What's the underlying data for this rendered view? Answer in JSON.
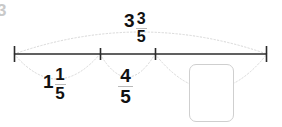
{
  "page": {
    "background_color": "#ffffff",
    "corner_mark": "3",
    "corner_mark_color": "#c9c9c9"
  },
  "diagram": {
    "type": "number-line-jump-diagram",
    "line_color": "#2b2b2b",
    "arc_color": "#d5d5d5",
    "arc_style": "dotted",
    "axis": {
      "x_start": 14,
      "x_end": 267,
      "y": 54,
      "ticks": [
        {
          "name": "tick-start",
          "x": 14,
          "height": 16
        },
        {
          "name": "tick-1",
          "x": 100,
          "height": 12
        },
        {
          "name": "tick-2",
          "x": 155,
          "height": 12
        },
        {
          "name": "tick-end",
          "x": 267,
          "height": 16
        }
      ]
    },
    "arcs": [
      {
        "name": "arc-total",
        "from_x": 14,
        "to_x": 267,
        "direction": "up",
        "label_id": "total"
      },
      {
        "name": "arc-segment-1",
        "from_x": 14,
        "to_x": 100,
        "direction": "down",
        "label_id": "seg1"
      },
      {
        "name": "arc-segment-2",
        "from_x": 100,
        "to_x": 155,
        "direction": "down",
        "label_id": "seg2"
      },
      {
        "name": "arc-segment-3",
        "from_x": 155,
        "to_x": 267,
        "direction": "down",
        "label_id": "seg3"
      }
    ]
  },
  "labels": {
    "total": {
      "name": "total-value",
      "type": "mixed-number",
      "whole": "3",
      "numerator": "3",
      "denominator": "5",
      "text": "3 3/5"
    },
    "seg1": {
      "name": "segment-1-value",
      "type": "mixed-number",
      "whole": "1",
      "numerator": "1",
      "denominator": "5",
      "text": "1 1/5"
    },
    "seg2": {
      "name": "segment-2-value",
      "type": "fraction",
      "numerator": "4",
      "denominator": "5",
      "text": "4/5"
    },
    "seg3": {
      "name": "segment-3-answer",
      "type": "input",
      "value": "",
      "placeholder": ""
    }
  }
}
